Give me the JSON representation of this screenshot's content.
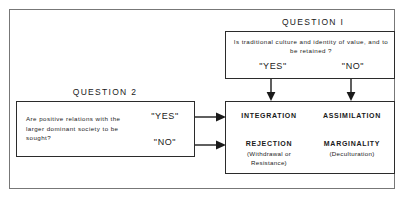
{
  "question1": {
    "heading": "QUESTION  I",
    "prompt": "Is traditional culture and identity of value, and to be retained ?",
    "yes_label": "\"YES\"",
    "no_label": "\"NO\""
  },
  "question2": {
    "heading": "QUESTION  2",
    "prompt": "Are positive relations with the larger dominant society to be sought?",
    "yes_label": "\"YES\"",
    "no_label": "\"NO\""
  },
  "outcomes": [
    {
      "id": "integration",
      "title": "INTEGRATION",
      "subtitle": ""
    },
    {
      "id": "assimilation",
      "title": "ASSIMILATION",
      "subtitle": ""
    },
    {
      "id": "rejection",
      "title": "REJECTION",
      "subtitle": "(Withdrawal or Resistance)"
    },
    {
      "id": "marginality",
      "title": "MARGINALITY",
      "subtitle": "(Deculturation)"
    }
  ],
  "colors": {
    "ink": "#1a1a1a",
    "box_border": "#2b2b2b",
    "frame_border": "#777777",
    "background": "#ffffff"
  }
}
